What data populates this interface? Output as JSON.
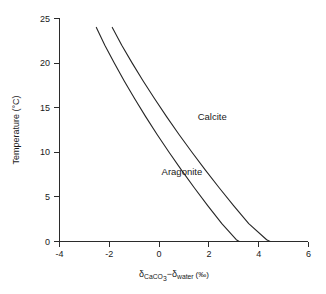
{
  "chart_data": {
    "type": "line",
    "title": "",
    "xlabel": "δCaCO3 − δwater (‰)",
    "ylabel": "Temperature (°C)",
    "xlim": [
      -4,
      6
    ],
    "ylim": [
      0,
      25
    ],
    "xticks": [
      -4,
      -2,
      0,
      2,
      4,
      6
    ],
    "yticks": [
      0,
      5,
      10,
      15,
      20,
      25
    ],
    "xtick_labels": [
      "-4",
      "-2",
      "0",
      "2",
      "4",
      "6"
    ],
    "ytick_labels": [
      "0",
      "5",
      "10",
      "15",
      "20",
      "25"
    ],
    "grid": false,
    "legend_position": "inline-annotation",
    "series": [
      {
        "name": "Aragonite",
        "label_x": 0.1,
        "label_y": 7.5,
        "x": [
          -2.52,
          -2.18,
          -1.8,
          -1.4,
          -0.98,
          -0.54,
          -0.08,
          0.4,
          0.9,
          1.42,
          1.96,
          2.52,
          3.1,
          3.22
        ],
        "y": [
          24.0,
          22.0,
          20.0,
          18.0,
          16.0,
          14.0,
          12.0,
          10.0,
          8.0,
          6.0,
          4.0,
          2.0,
          0.2,
          0.0
        ]
      },
      {
        "name": "Calcite",
        "label_x": 1.55,
        "label_y": 13.6,
        "x": [
          -1.88,
          -1.5,
          -1.08,
          -0.64,
          -0.18,
          0.3,
          0.8,
          1.32,
          1.86,
          2.42,
          3.0,
          3.6,
          4.32,
          4.46
        ],
        "y": [
          24.0,
          22.0,
          20.0,
          18.0,
          16.0,
          14.0,
          12.0,
          10.0,
          8.0,
          6.0,
          4.0,
          2.0,
          0.2,
          0.0
        ]
      }
    ],
    "xlabel_parts": {
      "delta1": "δ",
      "sub1": "CaCO",
      "sub1_num": "3",
      "minus": "−",
      "delta2": "δ",
      "sub2": "water",
      "unit": "(‰)"
    },
    "colors": {
      "background": "#ffffff",
      "axis": "#2b2b2b",
      "line": "#262626",
      "text": "#1a1a1a"
    }
  }
}
